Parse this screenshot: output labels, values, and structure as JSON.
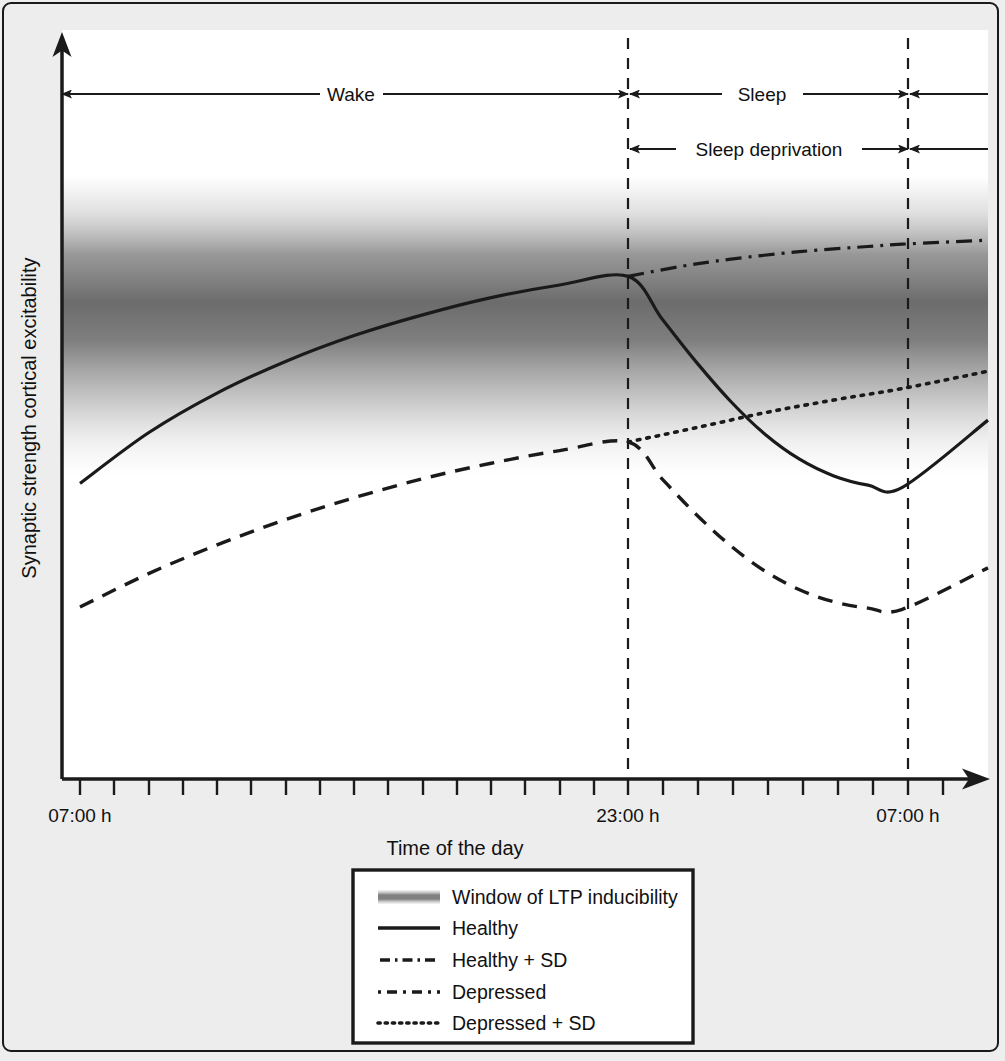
{
  "figure": {
    "background_color": "#ededed",
    "plot_background_color": "#ffffff",
    "line_color": "#1a1a1a"
  },
  "chart_data": {
    "type": "line",
    "title": "",
    "xlabel": "Time of the day",
    "ylabel": "Synaptic strength cortical excitability",
    "x_tick_labels": [
      "07:00 h",
      "23:00 h",
      "07:00 h"
    ],
    "x_tick_positions_hours": [
      0,
      16,
      24
    ],
    "xlim_hours": [
      0,
      26.5
    ],
    "grid": false,
    "legend_position": "below-axes-center",
    "annotations": [
      {
        "label": "Wake",
        "from_hours": 0,
        "to_hours": 16,
        "row": 1
      },
      {
        "label": "Sleep",
        "from_hours": 16,
        "to_hours": 24,
        "row": 1
      },
      {
        "label": "Sleep deprivation",
        "from_hours": 16,
        "to_hours": 24,
        "row": 2
      }
    ],
    "vertical_markers_hours": [
      16,
      24
    ],
    "band": {
      "name": "Window of LTP inducibility",
      "description": "Grey vertical gradient band, densest in the middle of the y-range"
    },
    "series": [
      {
        "name": "Healthy",
        "style": "solid",
        "points": [
          {
            "h": 0.0,
            "y": 0.455
          },
          {
            "h": 2.0,
            "y": 0.543
          },
          {
            "h": 4.0,
            "y": 0.612
          },
          {
            "h": 6.0,
            "y": 0.667
          },
          {
            "h": 8.0,
            "y": 0.712
          },
          {
            "h": 10.0,
            "y": 0.748
          },
          {
            "h": 12.0,
            "y": 0.778
          },
          {
            "h": 14.0,
            "y": 0.8
          },
          {
            "h": 16.0,
            "y": 0.815
          },
          {
            "h": 17.0,
            "y": 0.74
          },
          {
            "h": 18.0,
            "y": 0.665
          },
          {
            "h": 19.0,
            "y": 0.597
          },
          {
            "h": 20.0,
            "y": 0.54
          },
          {
            "h": 21.0,
            "y": 0.497
          },
          {
            "h": 22.0,
            "y": 0.468
          },
          {
            "h": 23.0,
            "y": 0.452
          },
          {
            "h": 24.0,
            "y": 0.448
          },
          {
            "h": 26.5,
            "y": 0.565
          }
        ]
      },
      {
        "name": "Healthy + SD",
        "style": "dash-dot",
        "points": [
          {
            "h": 16.0,
            "y": 0.815
          },
          {
            "h": 17.5,
            "y": 0.832
          },
          {
            "h": 19.0,
            "y": 0.845
          },
          {
            "h": 21.0,
            "y": 0.858
          },
          {
            "h": 23.0,
            "y": 0.867
          },
          {
            "h": 24.0,
            "y": 0.871
          },
          {
            "h": 26.5,
            "y": 0.878
          }
        ]
      },
      {
        "name": "Depressed",
        "style": "dashed",
        "points": [
          {
            "h": 0.0,
            "y": 0.24
          },
          {
            "h": 2.0,
            "y": 0.298
          },
          {
            "h": 4.0,
            "y": 0.348
          },
          {
            "h": 6.0,
            "y": 0.392
          },
          {
            "h": 8.0,
            "y": 0.43
          },
          {
            "h": 10.0,
            "y": 0.463
          },
          {
            "h": 12.0,
            "y": 0.49
          },
          {
            "h": 14.0,
            "y": 0.512
          },
          {
            "h": 16.0,
            "y": 0.527
          },
          {
            "h": 17.0,
            "y": 0.462
          },
          {
            "h": 18.0,
            "y": 0.4
          },
          {
            "h": 19.0,
            "y": 0.346
          },
          {
            "h": 20.0,
            "y": 0.302
          },
          {
            "h": 21.0,
            "y": 0.27
          },
          {
            "h": 22.0,
            "y": 0.249
          },
          {
            "h": 23.0,
            "y": 0.238
          },
          {
            "h": 24.0,
            "y": 0.236
          },
          {
            "h": 26.5,
            "y": 0.308
          }
        ]
      },
      {
        "name": "Depressed + SD",
        "style": "dotted",
        "points": [
          {
            "h": 16.0,
            "y": 0.527
          },
          {
            "h": 18.0,
            "y": 0.552
          },
          {
            "h": 20.0,
            "y": 0.578
          },
          {
            "h": 22.0,
            "y": 0.6
          },
          {
            "h": 24.0,
            "y": 0.62
          },
          {
            "h": 26.5,
            "y": 0.65
          }
        ]
      }
    ]
  },
  "legend": {
    "items": [
      {
        "label": "Window of LTP inducibility",
        "swatch": "gradient-band"
      },
      {
        "label": "Healthy",
        "swatch": "solid-line"
      },
      {
        "label": "Healthy + SD",
        "swatch": "dash-dot-line"
      },
      {
        "label": "Depressed",
        "swatch": "dashed-line"
      },
      {
        "label": "Depressed + SD",
        "swatch": "dotted-line"
      }
    ]
  }
}
